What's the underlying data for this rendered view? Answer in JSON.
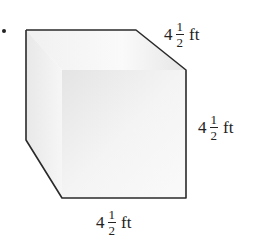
{
  "figure": {
    "type": "cube",
    "colors": {
      "edge": "#2a2a2a",
      "front_face": "#f2f2f2",
      "top_face": "#f5f5f5",
      "side_face": "#e6e6e6"
    }
  },
  "dimensions": {
    "top": {
      "whole": "4",
      "numerator": "1",
      "denominator": "2",
      "unit": "ft"
    },
    "right": {
      "whole": "4",
      "numerator": "1",
      "denominator": "2",
      "unit": "ft"
    },
    "bottom": {
      "whole": "4",
      "numerator": "1",
      "denominator": "2",
      "unit": "ft"
    }
  }
}
